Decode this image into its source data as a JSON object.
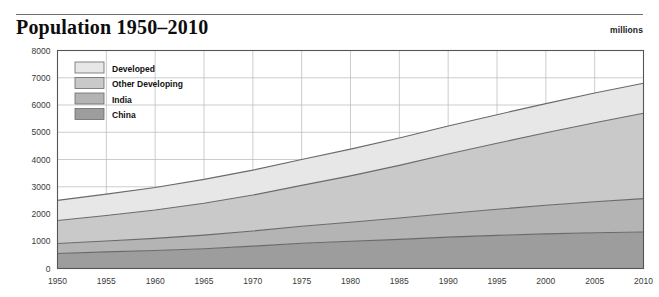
{
  "header": {
    "title": "Population 1950–2010",
    "unit_label": "millions"
  },
  "chart_data": {
    "type": "area",
    "stacked": true,
    "title": "Population 1950–2010",
    "subtitle": "",
    "xlabel": "",
    "ylabel": "millions",
    "grid": true,
    "legend_position": "top-left-inside",
    "xlim": [
      1950,
      2010
    ],
    "ylim": [
      0,
      8000
    ],
    "ytick_step": 1000,
    "xtick_step": 5,
    "x": [
      1950,
      1955,
      1960,
      1965,
      1970,
      1975,
      1980,
      1985,
      1990,
      1995,
      2000,
      2005,
      2010
    ],
    "xticklabels": [
      "1950",
      "1955",
      "1960",
      "1965",
      "1970",
      "1975",
      "1980",
      "1985",
      "1990",
      "1995",
      "2000",
      "2005",
      "2010"
    ],
    "yticklabels": [
      "0",
      "1000",
      "2000",
      "3000",
      "4000",
      "5000",
      "6000",
      "7000",
      "8000"
    ],
    "yticks": [
      0,
      1000,
      2000,
      3000,
      4000,
      5000,
      6000,
      7000,
      8000
    ],
    "stack_order_bottom_to_top": [
      "China",
      "India",
      "Other Developing",
      "Developed"
    ],
    "series": [
      {
        "name": "China",
        "color": "#9d9d9d",
        "values": [
          550,
          610,
          660,
          725,
          820,
          925,
          1000,
          1070,
          1150,
          1215,
          1270,
          1310,
          1340
        ]
      },
      {
        "name": "India",
        "color": "#b4b4b4",
        "values": [
          370,
          400,
          445,
          500,
          555,
          625,
          700,
          785,
          870,
          960,
          1050,
          1140,
          1225
        ]
      },
      {
        "name": "Other Developing",
        "color": "#c9c9c9",
        "values": [
          840,
          935,
          1040,
          1170,
          1320,
          1500,
          1700,
          1930,
          2180,
          2420,
          2660,
          2900,
          3130
        ]
      },
      {
        "name": "Developed",
        "color": "#e7e7e7",
        "values": [
          740,
          785,
          830,
          875,
          915,
          950,
          980,
          1005,
          1030,
          1050,
          1070,
          1090,
          1105
        ]
      }
    ],
    "cumulative_top_bottom_to_top": {
      "China": [
        550,
        610,
        660,
        725,
        820,
        925,
        1000,
        1070,
        1150,
        1215,
        1270,
        1310,
        1340
      ],
      "India": [
        920,
        1010,
        1105,
        1225,
        1375,
        1550,
        1700,
        1855,
        2020,
        2175,
        2320,
        2450,
        2565
      ],
      "Other Developing": [
        1760,
        1945,
        2145,
        2395,
        2695,
        3050,
        3400,
        3785,
        4200,
        4595,
        4980,
        5350,
        5695
      ],
      "Developed": [
        2500,
        2730,
        2975,
        3270,
        3610,
        4000,
        4380,
        4790,
        5230,
        5645,
        6050,
        6440,
        6800
      ]
    },
    "legend": [
      {
        "label": "Developed",
        "color": "#e7e7e7"
      },
      {
        "label": "Other Developing",
        "color": "#c9c9c9"
      },
      {
        "label": "India",
        "color": "#b4b4b4"
      },
      {
        "label": "China",
        "color": "#9d9d9d"
      }
    ]
  }
}
